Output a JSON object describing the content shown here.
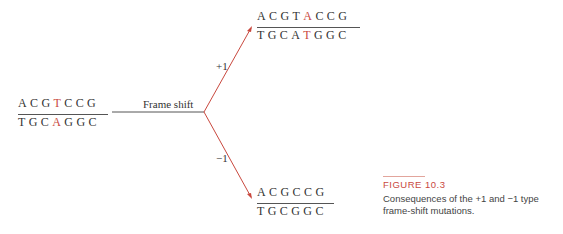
{
  "figure": {
    "title": "FIGURE 10.3",
    "caption": "Consequences of the +1 and −1 type frame-shift mutations.",
    "accent_color": "#c9483e"
  },
  "original": {
    "top_strand": [
      "A",
      "C",
      "G",
      "T",
      "C",
      "C",
      "G"
    ],
    "bottom_strand": [
      "T",
      "G",
      "C",
      "A",
      "G",
      "G",
      "C"
    ],
    "mutated_index": 3
  },
  "process_label": "Frame shift",
  "branches": {
    "plus": {
      "label": "+1",
      "top_strand": [
        "A",
        "C",
        "G",
        "T",
        "A",
        "C",
        "C",
        "G"
      ],
      "bottom_strand": [
        "T",
        "G",
        "C",
        "A",
        "T",
        "G",
        "G",
        "C"
      ],
      "mutated_index": 4
    },
    "minus": {
      "label": "−1",
      "top_strand": [
        "A",
        "C",
        "G",
        "C",
        "C",
        "G"
      ],
      "bottom_strand": [
        "T",
        "G",
        "C",
        "G",
        "G",
        "C"
      ]
    }
  }
}
